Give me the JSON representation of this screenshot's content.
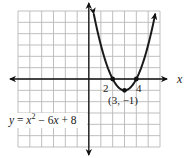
{
  "chart_data": {
    "type": "line",
    "title": "",
    "equation": "y = x² − 6x + 8",
    "equation_parts": {
      "lhs": "y",
      "eq": " = ",
      "x1": "x",
      "exp": "2",
      "mid": " − 6",
      "x2": "x",
      "tail": " + 8"
    },
    "xlabel": "x",
    "ylabel": "",
    "xlim": [
      -6,
      6
    ],
    "ylim": [
      -6,
      6
    ],
    "grid": true,
    "series": [
      {
        "name": "y = x^2 - 6x + 8",
        "function": "x^2 - 6x + 8",
        "x": [
          0.4,
          1,
          1.5,
          2,
          2.5,
          3,
          3.5,
          4,
          4.5,
          5,
          5.6
        ],
        "y": [
          5.76,
          3,
          1.25,
          0,
          -0.75,
          -1,
          -0.75,
          0,
          1.25,
          3,
          5.76
        ]
      }
    ],
    "points": [
      {
        "x": 2,
        "y": 0,
        "label": "2"
      },
      {
        "x": 4,
        "y": 0,
        "label": "4"
      },
      {
        "x": 3,
        "y": -1,
        "label": "(3, −1)"
      }
    ],
    "annotations": {
      "root_left": "2",
      "root_right": "4",
      "vertex": "(3, −1)"
    }
  },
  "colors": {
    "grid": "#b8b8b8",
    "axis": "#111111",
    "curve": "#1a1a1a"
  }
}
